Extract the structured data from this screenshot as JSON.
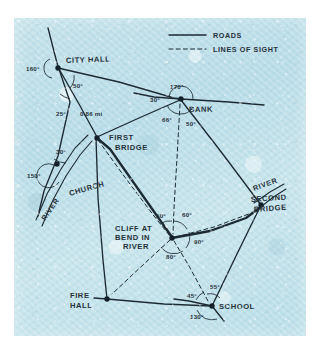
{
  "figure": {
    "kind": "hand-drawn-surveying-map",
    "medium_note": "pencil sketch on blue textured paper"
  },
  "legend": {
    "items": [
      {
        "label": "ROADS",
        "style": "solid",
        "icon": "solid-line-icon"
      },
      {
        "label": "LINES OF SIGHT",
        "style": "dashed",
        "icon": "dashed-line-icon"
      }
    ]
  },
  "places": [
    {
      "id": "city-hall",
      "label": "CITY HALL"
    },
    {
      "id": "bank",
      "label": "BANK"
    },
    {
      "id": "first-bridge",
      "label_line1": "FIRST",
      "label_line2": "BRIDGE"
    },
    {
      "id": "church",
      "label": "CHURCH"
    },
    {
      "id": "cliff",
      "label_line1": "CLIFF AT",
      "label_line2": "BEND IN",
      "label_line3": "RIVER"
    },
    {
      "id": "second-bridge",
      "label_line1": "SECOND",
      "label_line2": "BRIDGE"
    },
    {
      "id": "fire-hall",
      "label_line1": "FIRE",
      "label_line2": "HALL"
    },
    {
      "id": "school",
      "label": "SCHOOL"
    }
  ],
  "features": [
    {
      "id": "river-left",
      "label": "RIVER"
    },
    {
      "id": "river-right",
      "label": "RIVER"
    }
  ],
  "measurements": {
    "distances": [
      {
        "id": "city-hall-to-first-bridge",
        "label": "0.86 mi"
      }
    ],
    "angles": [
      {
        "id": "city-hall-exterior",
        "at": "city-hall",
        "label": "160°"
      },
      {
        "id": "city-hall-interior",
        "at": "city-hall",
        "label": "50°"
      },
      {
        "id": "city-hall-lower",
        "at": "city-hall",
        "label": "25°"
      },
      {
        "id": "bank-straight",
        "at": "bank",
        "label": "170°"
      },
      {
        "id": "bank-west",
        "at": "bank",
        "label": "30°"
      },
      {
        "id": "bank-sight",
        "at": "bank",
        "label": "66°"
      },
      {
        "id": "bank-south",
        "at": "bank",
        "label": "50°"
      },
      {
        "id": "church-upper",
        "at": "church",
        "label": "30°"
      },
      {
        "id": "church-exterior",
        "at": "church",
        "label": "150°"
      },
      {
        "id": "cliff-northwest",
        "at": "cliff",
        "label": "50°"
      },
      {
        "id": "cliff-northeast",
        "at": "cliff",
        "label": "60°"
      },
      {
        "id": "cliff-east",
        "at": "cliff",
        "label": "90°"
      },
      {
        "id": "cliff-south",
        "at": "cliff",
        "label": "80°"
      },
      {
        "id": "school-north",
        "at": "school",
        "label": "55°"
      },
      {
        "id": "school-west",
        "at": "school",
        "label": "45°"
      },
      {
        "id": "school-south",
        "at": "school",
        "label": "130°"
      }
    ]
  },
  "colors": {
    "paper": "#c2e1ea",
    "ink": "#1d2a33",
    "page": "#ffffff"
  }
}
